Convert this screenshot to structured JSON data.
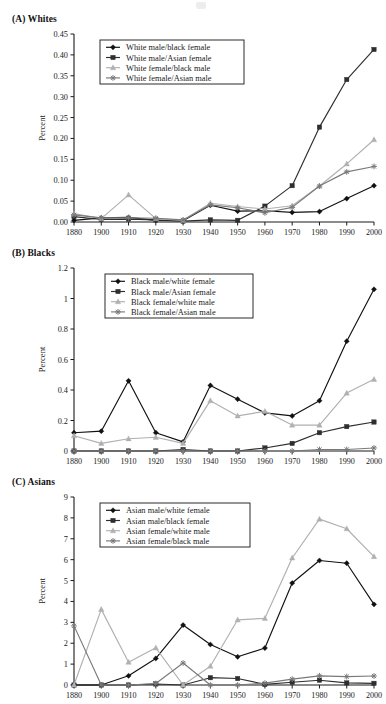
{
  "figure": {
    "ylabel": "Percent",
    "xticks": [
      "1880",
      "1900",
      "1910",
      "1920",
      "1930",
      "1940",
      "1950",
      "1960",
      "1970",
      "1980",
      "1990",
      "2000"
    ]
  },
  "colors": {
    "series1": "#111111",
    "series2": "#2e2e2e",
    "series3": "#b0b0b0",
    "series4": "#7a7a7a",
    "axis": "#1a1a1a",
    "legend_border": "#2b2b2b",
    "background": "#ffffff"
  },
  "panels": [
    {
      "id": "A",
      "title": "(A) Whites",
      "yticks": [
        "0.00",
        "0.05",
        "0.10",
        "0.15",
        "0.20",
        "0.25",
        "0.30",
        "0.35",
        "0.40",
        "0.45"
      ]
    },
    {
      "id": "B",
      "title": "(B) Blacks",
      "yticks": [
        "0",
        "0.2",
        "0.4",
        "0.6",
        "0.8",
        "1",
        "1.2"
      ]
    },
    {
      "id": "C",
      "title": "(C) Asians",
      "yticks": [
        "0",
        "1",
        "2",
        "3",
        "4",
        "5",
        "6",
        "7",
        "8",
        "9"
      ]
    }
  ],
  "chart_data": [
    {
      "type": "line",
      "title": "(A) Whites",
      "xlabel": "",
      "ylabel": "Percent",
      "x": [
        1880,
        1900,
        1910,
        1920,
        1930,
        1940,
        1950,
        1960,
        1970,
        1980,
        1990,
        2000
      ],
      "categories": [
        "1880",
        "1900",
        "1910",
        "1920",
        "1930",
        "1940",
        "1950",
        "1960",
        "1970",
        "1980",
        "1990",
        "2000"
      ],
      "ylim": [
        0,
        0.45
      ],
      "yticks": [
        0,
        0.05,
        0.1,
        0.15,
        0.2,
        0.25,
        0.3,
        0.35,
        0.4,
        0.45
      ],
      "grid": false,
      "legend_position": "upper-left",
      "series": [
        {
          "name": "White male/black female",
          "marker": "diamond",
          "color": "#111111",
          "values": [
            0.004,
            0.01,
            0.011,
            0.004,
            0.003,
            0.04,
            0.026,
            0.027,
            0.023,
            0.025,
            0.056,
            0.087
          ]
        },
        {
          "name": "White male/Asian female",
          "marker": "square",
          "color": "#2e2e2e",
          "values": [
            0.013,
            0.006,
            0.007,
            0.005,
            0.002,
            0.005,
            0.004,
            0.038,
            0.087,
            0.227,
            0.341,
            0.413
          ]
        },
        {
          "name": "White female/black male",
          "marker": "triangle",
          "color": "#b0b0b0",
          "values": [
            0.02,
            0.008,
            0.065,
            0.008,
            0.004,
            0.045,
            0.037,
            0.031,
            0.039,
            0.086,
            0.139,
            0.197
          ]
        },
        {
          "name": "White female/Asian male",
          "marker": "star",
          "color": "#7a7a7a",
          "values": [
            0.017,
            0.01,
            0.01,
            0.009,
            0.005,
            0.041,
            0.034,
            0.022,
            0.035,
            0.086,
            0.12,
            0.133
          ]
        }
      ]
    },
    {
      "type": "line",
      "title": "(B) Blacks",
      "xlabel": "",
      "ylabel": "Percent",
      "x": [
        1880,
        1900,
        1910,
        1920,
        1930,
        1940,
        1950,
        1960,
        1970,
        1980,
        1990,
        2000
      ],
      "categories": [
        "1880",
        "1900",
        "1910",
        "1920",
        "1930",
        "1940",
        "1950",
        "1960",
        "1970",
        "1980",
        "1990",
        "2000"
      ],
      "ylim": [
        0,
        1.2
      ],
      "yticks": [
        0,
        0.2,
        0.4,
        0.6,
        0.8,
        1,
        1.2
      ],
      "grid": false,
      "legend_position": "upper-left",
      "series": [
        {
          "name": "Black male/white female",
          "marker": "diamond",
          "color": "#111111",
          "values": [
            0.12,
            0.13,
            0.46,
            0.12,
            0.06,
            0.43,
            0.34,
            0.25,
            0.23,
            0.33,
            0.72,
            1.06
          ]
        },
        {
          "name": "Black male/Asian female",
          "marker": "square",
          "color": "#2e2e2e",
          "values": [
            0.0,
            0.0,
            0.0,
            0.0,
            0.01,
            0.0,
            0.0,
            0.02,
            0.05,
            0.12,
            0.16,
            0.19
          ]
        },
        {
          "name": "Black female/white male",
          "marker": "triangle",
          "color": "#b0b0b0",
          "values": [
            0.1,
            0.05,
            0.08,
            0.09,
            0.05,
            0.33,
            0.23,
            0.26,
            0.17,
            0.17,
            0.38,
            0.47
          ]
        },
        {
          "name": "Black female/Asian male",
          "marker": "star",
          "color": "#7a7a7a",
          "values": [
            0.0,
            0.0,
            0.0,
            0.0,
            0.0,
            0.0,
            0.0,
            0.0,
            0.0,
            0.01,
            0.01,
            0.02
          ]
        }
      ]
    },
    {
      "type": "line",
      "title": "(C) Asians",
      "xlabel": "",
      "ylabel": "Percent",
      "x": [
        1880,
        1900,
        1910,
        1920,
        1930,
        1940,
        1950,
        1960,
        1970,
        1980,
        1990,
        2000
      ],
      "categories": [
        "1880",
        "1900",
        "1910",
        "1920",
        "1930",
        "1940",
        "1950",
        "1960",
        "1970",
        "1980",
        "1990",
        "2000"
      ],
      "ylim": [
        0,
        9
      ],
      "yticks": [
        0,
        1,
        2,
        3,
        4,
        5,
        6,
        7,
        8,
        9
      ],
      "grid": false,
      "legend_position": "upper-left",
      "series": [
        {
          "name": "Asian male/white female",
          "marker": "diamond",
          "color": "#111111",
          "values": [
            0.0,
            0.0,
            0.44,
            1.27,
            2.87,
            1.94,
            1.35,
            1.77,
            4.88,
            5.96,
            5.83,
            3.86
          ]
        },
        {
          "name": "Asian male/black female",
          "marker": "square",
          "color": "#2e2e2e",
          "values": [
            0.0,
            0.0,
            0.0,
            0.05,
            0.0,
            0.35,
            0.31,
            0.03,
            0.13,
            0.23,
            0.1,
            0.08
          ]
        },
        {
          "name": "Asian female/white male",
          "marker": "triangle",
          "color": "#b0b0b0",
          "values": [
            0.0,
            3.62,
            1.09,
            1.78,
            0.0,
            0.9,
            3.12,
            3.19,
            6.08,
            7.94,
            7.48,
            6.15
          ]
        },
        {
          "name": "Asian female/black male",
          "marker": "star",
          "color": "#7a7a7a",
          "values": [
            2.83,
            0.0,
            0.0,
            0.07,
            1.05,
            0.0,
            0.0,
            0.09,
            0.28,
            0.44,
            0.4,
            0.43
          ]
        }
      ]
    }
  ]
}
